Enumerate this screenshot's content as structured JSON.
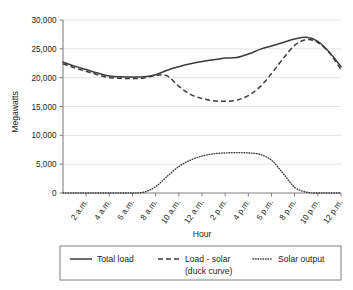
{
  "chart_data": {
    "type": "line",
    "title": "",
    "xlabel": "Hour",
    "ylabel": "Megawatts",
    "xlim": [
      0,
      24
    ],
    "ylim": [
      0,
      30000
    ],
    "grid": true,
    "legend_position": "bottom",
    "ytick_labels": [
      "0",
      "5,000",
      "10,000",
      "15,000",
      "20,000",
      "25,000",
      "30,000"
    ],
    "ytick_values": [
      0,
      5000,
      10000,
      15000,
      20000,
      25000,
      30000
    ],
    "xtick_labels": [
      "2 a.m.",
      "4 a.m.",
      "6 a.m.",
      "8 a.m.",
      "10 a.m.",
      "12 a.m.",
      "2 p.m.",
      "4 p.m.",
      "6 p.m.",
      "8 p.m.",
      "10 p.m.",
      "12 p.m."
    ],
    "xtick_values": [
      2,
      4,
      6,
      8,
      10,
      12,
      14,
      16,
      18,
      20,
      22,
      24
    ],
    "x": [
      0,
      1,
      2,
      3,
      4,
      5,
      6,
      7,
      8,
      9,
      10,
      11,
      12,
      13,
      14,
      15,
      16,
      17,
      18,
      19,
      20,
      21,
      22,
      23,
      24
    ],
    "series": [
      {
        "name": "Total load",
        "style": "solid",
        "color": "#3b3b3b",
        "values": [
          22700,
          22000,
          21400,
          20800,
          20300,
          20150,
          20100,
          20150,
          20500,
          21300,
          21900,
          22400,
          22800,
          23100,
          23400,
          23500,
          24100,
          24900,
          25500,
          26100,
          26700,
          27000,
          26300,
          24400,
          21900
        ]
      },
      {
        "name": "Load - solar (duck curve)",
        "style": "dashed",
        "color": "#3b3b3b",
        "values": [
          22400,
          21700,
          21100,
          20500,
          20000,
          19900,
          19850,
          19950,
          20400,
          20300,
          18500,
          17100,
          16400,
          16000,
          15900,
          16100,
          16900,
          18400,
          20700,
          23300,
          25600,
          26600,
          26100,
          24300,
          21400
        ]
      },
      {
        "name": "Solar output",
        "style": "dotted",
        "color": "#3b3b3b",
        "values": [
          0,
          0,
          0,
          0,
          0,
          0,
          0,
          150,
          1100,
          2900,
          4600,
          5700,
          6400,
          6800,
          6950,
          7000,
          6950,
          6700,
          5700,
          3400,
          1000,
          150,
          0,
          0,
          0
        ]
      }
    ]
  },
  "legend": {
    "items": [
      {
        "label": "Total load",
        "style": "solid"
      },
      {
        "label": "Load - solar",
        "label2": "(duck curve)",
        "style": "dashed"
      },
      {
        "label": "Solar output",
        "style": "dotted"
      }
    ]
  }
}
